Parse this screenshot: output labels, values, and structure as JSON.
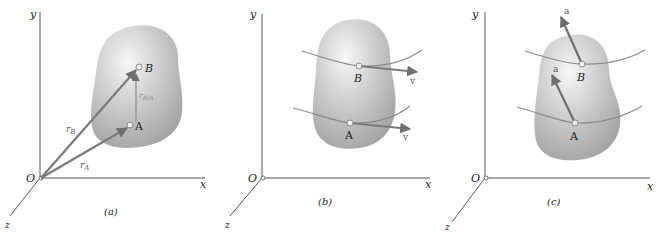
{
  "figure": {
    "panels": [
      {
        "id": "a",
        "caption": "(a)",
        "axes": {
          "x": "x",
          "y": "y",
          "z": "z",
          "origin": "O"
        },
        "points": [
          {
            "label": "A"
          },
          {
            "label": "B"
          }
        ],
        "vectors": [
          {
            "label": "r",
            "sub": "B",
            "from": "O",
            "to": "B"
          },
          {
            "label": "r",
            "sub": "A",
            "from": "O",
            "to": "A"
          },
          {
            "label": "r",
            "sub": "B/A",
            "from": "A",
            "to": "B"
          }
        ]
      },
      {
        "id": "b",
        "caption": "(b)",
        "axes": {
          "x": "x",
          "y": "y",
          "z": "z",
          "origin": "O"
        },
        "points": [
          {
            "label": "B"
          },
          {
            "label": "A"
          }
        ],
        "vectors": [
          {
            "label": "v",
            "at": "B"
          },
          {
            "label": "v",
            "at": "A"
          }
        ]
      },
      {
        "id": "c",
        "caption": "(c)",
        "axes": {
          "x": "x",
          "y": "y",
          "z": "z",
          "origin": "O"
        },
        "points": [
          {
            "label": "B"
          },
          {
            "label": "A"
          }
        ],
        "vectors": [
          {
            "label": "a",
            "at": "B"
          },
          {
            "label": "a",
            "at": "A"
          }
        ]
      }
    ],
    "colors": {
      "axis": "#555555",
      "vector": "#7a7a7a",
      "body_light": "#f2f2f2",
      "body_dark": "#a8a8a8",
      "path": "#8a8a8a",
      "text": "#222222"
    }
  }
}
